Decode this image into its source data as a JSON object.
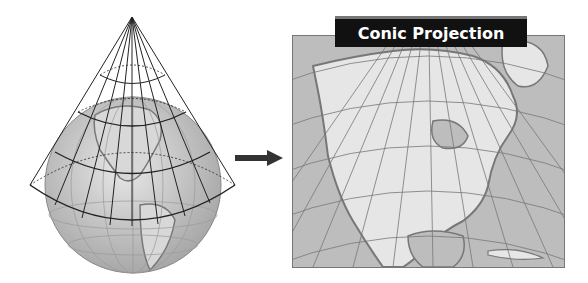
{
  "title": "Conic Projection",
  "figure": {
    "left_panel": "globe-with-cone",
    "arrow": "right-arrow",
    "right_panel": "conic-projection-map-north-america"
  },
  "colors": {
    "title_bg": "#111111",
    "title_text": "#ffffff",
    "land": "#e6e6e6",
    "water": "#bdbdbd",
    "grid": "#777777"
  }
}
